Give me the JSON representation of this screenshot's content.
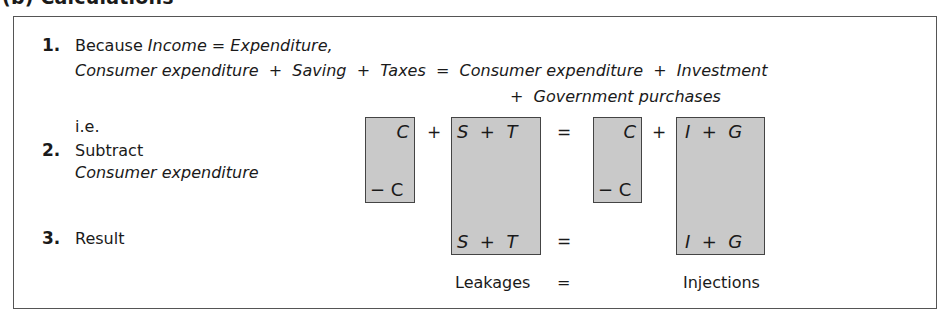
{
  "title": "(b) Calculations",
  "steps": [
    {
      "number": "1.",
      "line1": {
        "lead": "Because",
        "income": "Income",
        "eq": "=",
        "expenditure": "Expenditure,"
      },
      "line2": {
        "text": "Consumer expenditure  +  Saving  +  Taxes  =  Consumer expenditure  +  Investment"
      },
      "line3": {
        "text": "+  Government purchases"
      }
    },
    {
      "number": "2.",
      "label": "Subtract",
      "sublabel": "Consumer expenditure"
    },
    {
      "number": "3.",
      "label": "Result"
    }
  ],
  "ie_label": "i.e.",
  "equation": {
    "boxes": [
      {
        "id": "c-left",
        "top": "C",
        "bottom": "− C"
      },
      {
        "id": "leakages",
        "top": "S  +  T",
        "bottom": "S  +  T"
      },
      {
        "id": "c-right",
        "top": "C",
        "bottom": "− C"
      },
      {
        "id": "injections",
        "top": "I  +  G",
        "bottom": "I  +  G"
      }
    ],
    "ops": {
      "plus1": "+",
      "eq1": "=",
      "plus2": "+",
      "eq2": "="
    },
    "result_labels": {
      "left": "Leakages",
      "eq": "=",
      "right": "Injections"
    }
  },
  "colors": {
    "box_fill": "#c9c9c9",
    "border": "#444444"
  }
}
